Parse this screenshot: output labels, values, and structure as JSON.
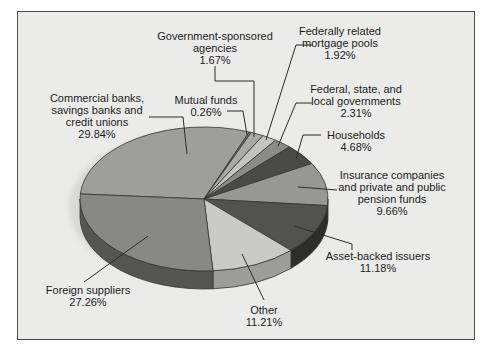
{
  "figure": {
    "background_color": "#ebebe9",
    "frame_border_color": "#4b4b4b",
    "text_color": "#1c1c1c",
    "leader_line_color": "#2b2b2b",
    "shadow_color": "#d8d8d6"
  },
  "chart_data": {
    "type": "pie",
    "style": "3d-extruded",
    "title": "",
    "legend": "none (callout labels with leader lines)",
    "direction": "clockwise",
    "geometry": {
      "cx": 204,
      "cy": 199,
      "rx": 124,
      "ry": 72,
      "depth": 18,
      "start_angle_deg": 176
    },
    "slices": [
      {
        "slug": "commercial-banks",
        "label": "Commercial banks, savings banks and credit unions",
        "lines": [
          "Commercial banks,",
          "savings banks and",
          "credit unions"
        ],
        "pct_label": "29.84%",
        "value": 29.84,
        "color": "#9e9e9c",
        "side_color": "#6b6b69",
        "callout": {
          "cx": 97,
          "top": 92,
          "leader": [
            [
              149,
              117
            ],
            [
              183,
              117
            ],
            [
              187,
              154
            ]
          ]
        }
      },
      {
        "slug": "mutual-funds",
        "label": "Mutual funds",
        "lines": [
          "Mutual funds"
        ],
        "pct_label": "0.26%",
        "value": 0.26,
        "color": "#777775",
        "side_color": "#4f4f4d",
        "callout": {
          "cx": 206,
          "top": 94,
          "leader": [
            [
              227,
              111
            ],
            [
              243,
              111
            ],
            [
              247,
              135
            ]
          ]
        }
      },
      {
        "slug": "government-sponsored-agencies",
        "label": "Government-sponsored agencies",
        "lines": [
          "Government-sponsored",
          "agencies"
        ],
        "pct_label": "1.67%",
        "value": 1.67,
        "color": "#a9a9a7",
        "side_color": "#737371",
        "callout": {
          "cx": 215,
          "top": 30,
          "leader": [
            [
              215,
              66
            ],
            [
              215,
              81
            ],
            [
              254,
              81
            ],
            [
              254,
              137
            ]
          ]
        }
      },
      {
        "slug": "federally-related-mortgage-pools",
        "label": "Federally related mortgage pools",
        "lines": [
          "Federally related",
          "mortgage pools"
        ],
        "pct_label": "1.92%",
        "value": 1.92,
        "color": "#c3c3c1",
        "side_color": "#8a8a88",
        "callout": {
          "cx": 340,
          "top": 25,
          "leader": [
            [
              313,
              45
            ],
            [
              296,
              45
            ],
            [
              266,
              140
            ]
          ]
        }
      },
      {
        "slug": "federal-state-local-governments",
        "label": "Federal, state, and local governments",
        "lines": [
          "Federal, state, and",
          "local governments"
        ],
        "pct_label": "2.31%",
        "value": 2.31,
        "color": "#8b8b89",
        "side_color": "#5e5e5c",
        "callout": {
          "cx": 356,
          "top": 83,
          "leader": [
            [
              312,
              103
            ],
            [
              296,
              103
            ],
            [
              278,
              146
            ]
          ]
        }
      },
      {
        "slug": "households",
        "label": "Households",
        "lines": [
          "Households"
        ],
        "pct_label": "4.68%",
        "value": 4.68,
        "color": "#4a4a48",
        "side_color": "#323230",
        "callout": {
          "cx": 356,
          "top": 129,
          "leader": [
            [
              321,
              135
            ],
            [
              303,
              135
            ],
            [
              296,
              159
            ]
          ]
        }
      },
      {
        "slug": "insurance-pension-funds",
        "label": "Insurance companies and private and public pension funds",
        "lines": [
          "Insurance companies",
          "and private and public",
          "pension funds"
        ],
        "pct_label": "9.66%",
        "value": 9.66,
        "color": "#979795",
        "side_color": "#646462",
        "callout": {
          "cx": 392,
          "top": 169,
          "leader": [
            [
              337,
              190
            ],
            [
              298,
              187
            ]
          ]
        }
      },
      {
        "slug": "asset-backed-issuers",
        "label": "Asset-backed issuers",
        "lines": [
          "Asset-backed issuers"
        ],
        "pct_label": "11.18%",
        "value": 11.18,
        "color": "#525250",
        "side_color": "#2d2d2b",
        "callout": {
          "cx": 378,
          "top": 250,
          "leader": [
            [
              294,
              226
            ],
            [
              352,
              244
            ],
            [
              352,
              250
            ]
          ]
        }
      },
      {
        "slug": "other",
        "label": "Other",
        "lines": [
          "Other"
        ],
        "pct_label": "11.21%",
        "value": 11.21,
        "color": "#cacac8",
        "side_color": "#9d9d9b",
        "callout": {
          "cx": 264,
          "top": 304,
          "leader": [
            [
              242,
              254
            ],
            [
              264,
              300
            ]
          ]
        }
      },
      {
        "slug": "foreign-suppliers",
        "label": "Foreign suppliers",
        "lines": [
          "Foreign suppliers"
        ],
        "pct_label": "27.26%",
        "value": 27.26,
        "color": "#888886",
        "side_color": "#555553",
        "callout": {
          "cx": 88,
          "top": 284,
          "leader": [
            [
              84,
              282
            ],
            [
              148,
              236
            ]
          ]
        }
      }
    ]
  }
}
